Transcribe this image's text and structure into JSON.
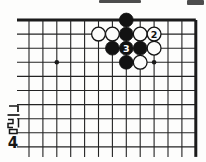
{
  "figure": {
    "caption_text": "그림 4",
    "caption_hangul": "그림",
    "figure_number": "4"
  },
  "board": {
    "type": "go-diagram",
    "description": "top-right corner region of a Go board",
    "colors": {
      "background": "#fdfdfc",
      "line": "#232323",
      "edge": "#1b1b1b",
      "black_stone": "#121212",
      "white_stone": "#fcfcfb",
      "stone_outline": "#141414"
    },
    "grid": {
      "cols": 13,
      "rows": 10,
      "origin_x": 29,
      "origin_y": 20,
      "col_spacing": 13.9,
      "row_spacing": 14.1,
      "left_overhang": 12,
      "bottom_overhang": 10,
      "edge_top": true,
      "edge_right": true,
      "inner_line_width": 1.1,
      "edge_line_width": 3,
      "stone_radius": 6.9,
      "star_radius": 2.3
    },
    "stones": [
      {
        "col": 8,
        "row": 1,
        "color": "black"
      },
      {
        "col": 6,
        "row": 2,
        "color": "white"
      },
      {
        "col": 7,
        "row": 2,
        "color": "white"
      },
      {
        "col": 8,
        "row": 2,
        "color": "black"
      },
      {
        "col": 9,
        "row": 2,
        "color": "white"
      },
      {
        "col": 10,
        "row": 2,
        "color": "white",
        "label": "2"
      },
      {
        "col": 7,
        "row": 3,
        "color": "black"
      },
      {
        "col": 8,
        "row": 3,
        "color": "black",
        "label": "3"
      },
      {
        "col": 9,
        "row": 3,
        "color": "black"
      },
      {
        "col": 10,
        "row": 3,
        "color": "white"
      },
      {
        "col": 8,
        "row": 4,
        "color": "black"
      },
      {
        "col": 9,
        "row": 4,
        "color": "white"
      }
    ],
    "star_points": [
      {
        "col": 3,
        "row": 4
      },
      {
        "col": 10,
        "row": 4
      }
    ]
  },
  "scan_artifacts": [
    {
      "x": 99,
      "y": 0,
      "width": 42,
      "height": 2.5
    },
    {
      "x": 187,
      "y": 0,
      "width": 17,
      "height": 4.5
    }
  ]
}
